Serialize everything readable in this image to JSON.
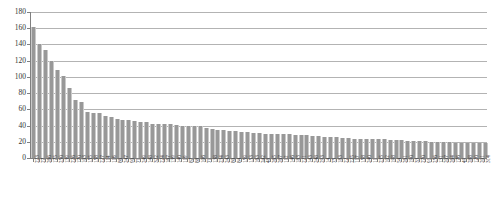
{
  "chart_data": {
    "type": "bar",
    "title": "",
    "subtitle": "",
    "xlabel": "",
    "ylabel": "",
    "ylim": [
      0,
      180
    ],
    "ytick_step": 20,
    "ytick_labels": [
      "180",
      "160",
      "140",
      "120",
      "100",
      "80",
      "60",
      "40",
      "20",
      "0"
    ],
    "grid": true,
    "legend": null,
    "legend_position": "none",
    "bar_color": "#989898",
    "gridline_color": "#b3b3b3",
    "axis_color": "#808080",
    "orientation": "vertical",
    "sorted": "descending",
    "categories": [
      "223",
      "27",
      "266",
      "175",
      "250",
      "139",
      "226",
      "170",
      "103",
      "155",
      "158",
      "227",
      "114",
      "116",
      "86",
      "247",
      "90",
      "71",
      "249",
      "148",
      "322",
      "224",
      "167",
      "139",
      "140",
      "119",
      "87",
      "88",
      "106",
      "71",
      "138",
      "234",
      "243",
      "80",
      "84",
      "159",
      "153",
      "163",
      "242",
      "48",
      "265",
      "267",
      "112",
      "146",
      "183",
      "221",
      "143",
      "248",
      "293",
      "14",
      "75",
      "183",
      "22",
      "225",
      "117",
      "158",
      "240",
      "11",
      "235",
      "102",
      "198",
      "54",
      "261",
      "190",
      "33",
      "270",
      "91",
      "256",
      "131",
      "207",
      "264",
      "176",
      "49",
      "288",
      "120",
      "201",
      "314"
    ],
    "values": [
      161,
      140,
      133,
      119,
      109,
      101,
      86,
      71,
      69,
      57,
      56,
      56,
      52,
      50,
      48,
      47,
      47,
      46,
      45,
      44,
      42,
      42,
      42,
      42,
      41,
      40,
      39,
      39,
      40,
      37,
      36,
      35,
      34,
      33,
      33,
      32,
      32,
      31,
      31,
      30,
      30,
      30,
      29,
      29,
      28,
      28,
      28,
      27,
      27,
      26,
      26,
      26,
      25,
      25,
      24,
      24,
      24,
      23,
      23,
      23,
      22,
      22,
      22,
      21,
      21,
      21,
      21,
      20,
      20,
      20,
      20,
      19,
      19,
      19,
      19,
      18,
      18
    ]
  }
}
